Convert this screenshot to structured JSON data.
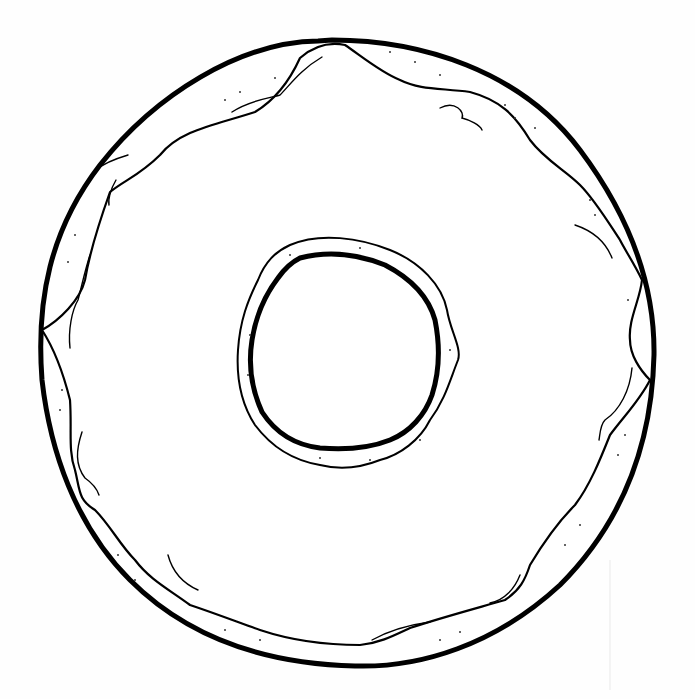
{
  "illustration": {
    "subject": "donut",
    "style": "black line-art coloring page",
    "parts": {
      "dough_outline": "donut-outline",
      "icing": "icing-glaze",
      "icing_highlights": "icing-highlight-strokes",
      "hole": "donut-hole",
      "sprinkle_dots": "dough-texture-dots"
    },
    "colors": {
      "line": "#000000",
      "background": "#ffffff",
      "texture_dots": "#333333"
    }
  }
}
